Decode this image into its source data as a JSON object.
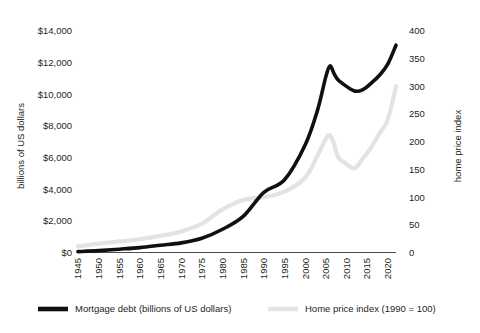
{
  "chart_data": {
    "type": "line",
    "title": "",
    "xlabel": "",
    "ylabel": "billions of US dollars",
    "y2label": "home price index",
    "xlim": [
      1945,
      2022
    ],
    "ylim": [
      0,
      14000
    ],
    "y2lim": [
      0,
      400
    ],
    "grid": false,
    "legend_position": "bottom",
    "x_ticks": [
      "1945",
      "1950",
      "1955",
      "1960",
      "1965",
      "1970",
      "1975",
      "1980",
      "1985",
      "1990",
      "1995",
      "2000",
      "2005",
      "2010",
      "2015",
      "2020"
    ],
    "y_ticks": [
      "$0",
      "$2,000",
      "$4,000",
      "$6,000",
      "$8,000",
      "$10,000",
      "$12,000",
      "$14,000"
    ],
    "y2_ticks": [
      "0",
      "50",
      "100",
      "150",
      "200",
      "250",
      "300",
      "350",
      "400"
    ],
    "colors": {
      "mortgage_debt": "#101010",
      "home_price_index": "#e3e3e3"
    },
    "series": [
      {
        "name": "Mortgage debt (billions of US dollars)",
        "axis": "left",
        "units": "billions of US dollars",
        "color": "#101010",
        "x": [
          1945,
          1950,
          1955,
          1960,
          1965,
          1970,
          1975,
          1980,
          1985,
          1990,
          1995,
          2000,
          2003,
          2005,
          2006,
          2007,
          2008,
          2010,
          2012,
          2014,
          2016,
          2018,
          2020,
          2022
        ],
        "values": [
          55,
          120,
          210,
          310,
          460,
          610,
          900,
          1470,
          2280,
          3800,
          4600,
          6800,
          9000,
          11100,
          11800,
          11300,
          10900,
          10500,
          10200,
          10300,
          10700,
          11200,
          11900,
          13100
        ]
      },
      {
        "name": "Home price index (1990 = 100)",
        "axis": "right",
        "units": "index, 1990 = 100",
        "color": "#e3e3e3",
        "x": [
          1945,
          1950,
          1955,
          1960,
          1965,
          1970,
          1975,
          1980,
          1985,
          1990,
          1995,
          2000,
          2003,
          2005,
          2006,
          2007,
          2008,
          2010,
          2012,
          2014,
          2016,
          2018,
          2020,
          2022
        ],
        "values": [
          11,
          16,
          20,
          24,
          30,
          38,
          52,
          78,
          95,
          100,
          110,
          135,
          175,
          205,
          212,
          196,
          172,
          160,
          152,
          170,
          190,
          215,
          240,
          300
        ]
      }
    ],
    "legend": [
      {
        "label": "Mortgage debt (billions of US dollars)",
        "color": "#101010"
      },
      {
        "label": "Home price index (1990 = 100)",
        "color": "#e3e3e3"
      }
    ]
  }
}
